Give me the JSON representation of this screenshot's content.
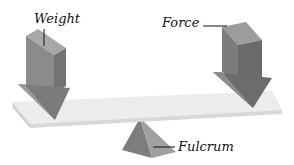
{
  "diagram": {
    "labels": {
      "weight": "Weight",
      "force": "Force",
      "fulcrum": "Fulcrum"
    },
    "colors": {
      "background": "#ffffff",
      "block_front": "#8a8a8a",
      "block_side": "#6e6e6e",
      "block_top": "#a9a9a9",
      "beam_top": "#ebebeb",
      "beam_front": "#d6d6d6",
      "fulcrum_left": "#7d7d7d",
      "fulcrum_right": "#9c9c9c",
      "leader_line": "#111111"
    }
  }
}
